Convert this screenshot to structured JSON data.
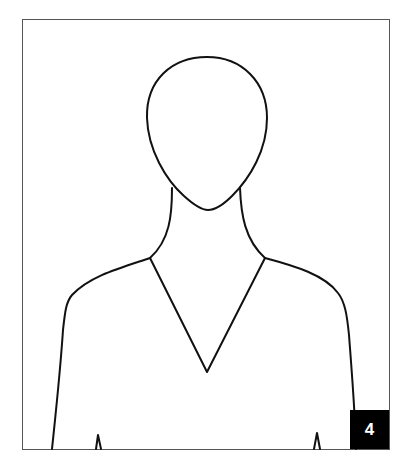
{
  "figure": {
    "stroke_color": "#111111",
    "frame_color": "#555555",
    "background": "#ffffff"
  },
  "badge": {
    "label": "4",
    "background": "#000000",
    "color": "#ffffff"
  }
}
